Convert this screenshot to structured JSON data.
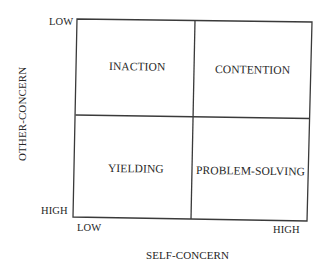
{
  "diagram": {
    "type": "2x2 matrix",
    "x_axis": {
      "title": "SELF-CONCERN",
      "low_label": "LOW",
      "high_label": "HIGH"
    },
    "y_axis": {
      "title": "OTHER-CONCERN",
      "low_label": "LOW",
      "high_label": "HIGH"
    },
    "quadrants": {
      "top_left": "INACTION",
      "top_right": "CONTENTION",
      "bottom_left": "YIELDING",
      "bottom_right": "PROBLEM-SOLVING"
    },
    "colors": {
      "line": "#3a3a3a",
      "text": "#262626",
      "background": "#ffffff"
    }
  }
}
